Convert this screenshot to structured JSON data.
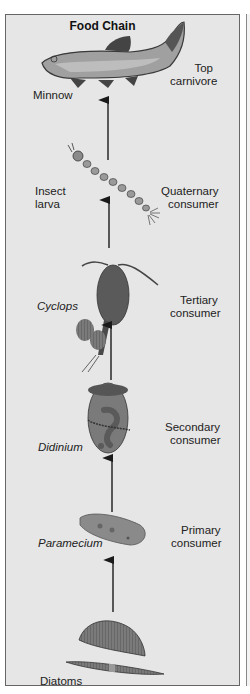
{
  "title": "Food Chain",
  "colors": {
    "panel_bg": "#e6e6e6",
    "border": "#666666",
    "arrow": "#1a1a1a",
    "organism_fill": "#8a8a8a",
    "text": "#222222"
  },
  "levels": [
    {
      "organism": "Minnow",
      "role_line1": "Top",
      "role_line2": "carnivore",
      "italic": false,
      "icon": "fish-icon"
    },
    {
      "organism_line1": "Insect",
      "organism_line2": "larva",
      "role_line1": "Quaternary",
      "role_line2": "consumer",
      "italic": false,
      "icon": "insect-larva-icon"
    },
    {
      "organism": "Cyclops",
      "role_line1": "Tertiary",
      "role_line2": "consumer",
      "italic": true,
      "icon": "copepod-icon"
    },
    {
      "organism": "Didinium",
      "role_line1": "Secondary",
      "role_line2": "consumer",
      "italic": true,
      "icon": "ciliate-icon"
    },
    {
      "organism": "Paramecium",
      "role_line1": "Primary",
      "role_line2": "consumer",
      "italic": true,
      "icon": "paramecium-icon"
    },
    {
      "organism": "Diatoms",
      "italic": false,
      "icon": "diatom-icon"
    }
  ]
}
